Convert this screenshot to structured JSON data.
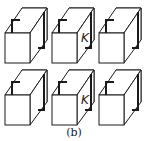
{
  "figure": {
    "caption": "(b)",
    "grid": {
      "rows": 2,
      "cols": 3
    },
    "cell_offsets": {
      "x": [
        0,
        47,
        94
      ],
      "y": [
        0,
        62
      ]
    },
    "cells": [
      {
        "row": 0,
        "col": 0,
        "label": ""
      },
      {
        "row": 0,
        "col": 1,
        "label": "K"
      },
      {
        "row": 0,
        "col": 2,
        "label": ""
      },
      {
        "row": 1,
        "col": 0,
        "label": ""
      },
      {
        "row": 1,
        "col": 1,
        "label": "K"
      },
      {
        "row": 1,
        "col": 2,
        "label": ""
      }
    ],
    "colors": {
      "stroke": "#1a1a1a",
      "fill": "#ffffff",
      "background": "#ffffff"
    }
  }
}
